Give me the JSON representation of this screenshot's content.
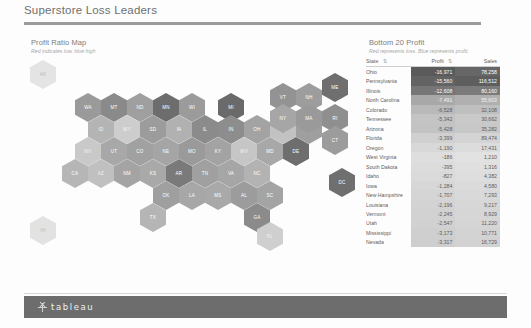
{
  "header": {
    "dashboard_title": "Superstore Loss Leaders"
  },
  "map_section": {
    "title": "Profit Ratio Map",
    "subtitle": "Red indicates low, blue high"
  },
  "table_section": {
    "title": "Bottom 20 Profit",
    "subtitle": "Red represents loss.  Blue represents profit.",
    "columns": [
      "State",
      "Profit",
      "Sales"
    ],
    "sort_icon": "sort-ascending-icon",
    "rows": [
      {
        "state": "Ohio",
        "profit": "-16,971",
        "sales": "78,258",
        "profit_bg": "#5a5a5a",
        "sales_bg": "#676767",
        "text": "#ffffff"
      },
      {
        "state": "Pennsylvania",
        "profit": "-15,560",
        "sales": "116,512",
        "profit_bg": "#636363",
        "sales_bg": "#5e5e5e",
        "text": "#ffffff"
      },
      {
        "state": "Illinois",
        "profit": "-12,608",
        "sales": "80,160",
        "profit_bg": "#767676",
        "sales_bg": "#7b7b7b",
        "text": "#ffffff"
      },
      {
        "state": "North Carolina",
        "profit": "-7,491",
        "sales": "55,603",
        "profit_bg": "#a8a8a8",
        "sales_bg": "#b0b0b0",
        "text": "#f4f4f4"
      },
      {
        "state": "Colorado",
        "profit": "-6,528",
        "sales": "32,108",
        "profit_bg": "#b9b9b9",
        "sales_bg": "#bfbfbf",
        "text": "#5d5d5d"
      },
      {
        "state": "Tennessee",
        "profit": "-5,342",
        "sales": "30,662",
        "profit_bg": "#c4c4c4",
        "sales_bg": "#c9c9c9",
        "text": "#5d5d5d"
      },
      {
        "state": "Arizona",
        "profit": "-5,428",
        "sales": "35,282",
        "profit_bg": "#c3c3c3",
        "sales_bg": "#c8c8c8",
        "text": "#5d5d5d"
      },
      {
        "state": "Florida",
        "profit": "-3,399",
        "sales": "89,474",
        "profit_bg": "#d0d0d0",
        "sales_bg": "#d4d4d4",
        "text": "#5d5d5d"
      },
      {
        "state": "Oregon",
        "profit": "-1,190",
        "sales": "17,431",
        "profit_bg": "#d8d8d8",
        "sales_bg": "#dcdcdc",
        "text": "#5d5d5d"
      },
      {
        "state": "West Virginia",
        "profit": "-186",
        "sales": "1,210",
        "profit_bg": "#dedede",
        "sales_bg": "#e2e2e2",
        "text": "#5d5d5d"
      },
      {
        "state": "South Dakota",
        "profit": "-395",
        "sales": "1,316",
        "profit_bg": "#dcdcdc",
        "sales_bg": "#e0e0e0",
        "text": "#5d5d5d"
      },
      {
        "state": "Idaho",
        "profit": "-827",
        "sales": "4,382",
        "profit_bg": "#dadada",
        "sales_bg": "#dedede",
        "text": "#5d5d5d"
      },
      {
        "state": "Iowa",
        "profit": "-1,284",
        "sales": "4,580",
        "profit_bg": "#d7d7d7",
        "sales_bg": "#dbdbdb",
        "text": "#5d5d5d"
      },
      {
        "state": "New Hampshire",
        "profit": "-1,707",
        "sales": "7,293",
        "profit_bg": "#d5d5d5",
        "sales_bg": "#d9d9d9",
        "text": "#5d5d5d"
      },
      {
        "state": "Louisiana",
        "profit": "-2,196",
        "sales": "9,217",
        "profit_bg": "#d3d3d3",
        "sales_bg": "#d7d7d7",
        "text": "#5d5d5d"
      },
      {
        "state": "Vermont",
        "profit": "-2,245",
        "sales": "8,929",
        "profit_bg": "#d2d2d2",
        "sales_bg": "#d6d6d6",
        "text": "#5d5d5d"
      },
      {
        "state": "Utah",
        "profit": "-2,547",
        "sales": "11,220",
        "profit_bg": "#d1d1d1",
        "sales_bg": "#d5d5d5",
        "text": "#5d5d5d"
      },
      {
        "state": "Mississippi",
        "profit": "-3,173",
        "sales": "10,771",
        "profit_bg": "#cfcfcf",
        "sales_bg": "#d3d3d3",
        "text": "#5d5d5d"
      },
      {
        "state": "Nevada",
        "profit": "-3,317",
        "sales": "16,729",
        "profit_bg": "#cecece",
        "sales_bg": "#d2d2d2",
        "text": "#5d5d5d"
      }
    ]
  },
  "hex_map": {
    "tiles": [
      {
        "abbr": "AK",
        "x": 6,
        "y": 4,
        "color": "#e4e4e4",
        "label": "#b8b8b8"
      },
      {
        "abbr": "WA",
        "x": 51,
        "y": 37,
        "color": "#9a9a9a",
        "label": "#ffffff"
      },
      {
        "abbr": "MT",
        "x": 77,
        "y": 37,
        "color": "#8a8a8a",
        "label": "#ffffff"
      },
      {
        "abbr": "ND",
        "x": 103,
        "y": 37,
        "color": "#9f9f9f",
        "label": "#ffffff"
      },
      {
        "abbr": "MN",
        "x": 129,
        "y": 37,
        "color": "#6d6d6d",
        "label": "#ffffff"
      },
      {
        "abbr": "WI",
        "x": 155,
        "y": 37,
        "color": "#9b9b9b",
        "label": "#ffffff"
      },
      {
        "abbr": "MI",
        "x": 194,
        "y": 37,
        "color": "#6a6a6a",
        "label": "#ffffff"
      },
      {
        "abbr": "VT",
        "x": 246,
        "y": 27,
        "color": "#939393",
        "label": "#ffffff"
      },
      {
        "abbr": "NH",
        "x": 272,
        "y": 27,
        "color": "#9d9d9d",
        "label": "#ffffff"
      },
      {
        "abbr": "ME",
        "x": 298,
        "y": 17,
        "color": "#6f6f6f",
        "label": "#ffffff"
      },
      {
        "abbr": "ID",
        "x": 64,
        "y": 59,
        "color": "#b4b4b4",
        "label": "#f4f4f4"
      },
      {
        "abbr": "WY",
        "x": 90,
        "y": 59,
        "color": "#cdcdcd",
        "label": "#f4f4f4"
      },
      {
        "abbr": "SD",
        "x": 116,
        "y": 59,
        "color": "#9c9c9c",
        "label": "#ffffff"
      },
      {
        "abbr": "IA",
        "x": 142,
        "y": 59,
        "color": "#b1b1b1",
        "label": "#ffffff"
      },
      {
        "abbr": "IL",
        "x": 168,
        "y": 59,
        "color": "#8b8b8b",
        "label": "#ffffff"
      },
      {
        "abbr": "IN",
        "x": 194,
        "y": 59,
        "color": "#8d8d8d",
        "label": "#ffffff"
      },
      {
        "abbr": "OH",
        "x": 220,
        "y": 59,
        "color": "#a3a3a3",
        "label": "#ffffff"
      },
      {
        "abbr": "PA",
        "x": 246,
        "y": 59,
        "color": "#c2c2c2",
        "label": "#f4f4f4"
      },
      {
        "abbr": "NJ",
        "x": 272,
        "y": 59,
        "color": "#9f9f9f",
        "label": "#ffffff"
      },
      {
        "abbr": "NY",
        "x": 246,
        "y": 48,
        "color": "#a6a6a6",
        "label": "#ffffff"
      },
      {
        "abbr": "MA",
        "x": 272,
        "y": 48,
        "color": "#9a9a9a",
        "label": "#ffffff"
      },
      {
        "abbr": "RI",
        "x": 298,
        "y": 48,
        "color": "#8f8f8f",
        "label": "#ffffff"
      },
      {
        "abbr": "CT",
        "x": 298,
        "y": 70,
        "color": "#9c9c9c",
        "label": "#ffffff"
      },
      {
        "abbr": "NV",
        "x": 51,
        "y": 81,
        "color": "#c9c9c9",
        "label": "#f4f4f4"
      },
      {
        "abbr": "UT",
        "x": 77,
        "y": 81,
        "color": "#a8a8a8",
        "label": "#ffffff"
      },
      {
        "abbr": "CO",
        "x": 103,
        "y": 81,
        "color": "#a1a1a1",
        "label": "#ffffff"
      },
      {
        "abbr": "NE",
        "x": 129,
        "y": 81,
        "color": "#a5a5a5",
        "label": "#ffffff"
      },
      {
        "abbr": "MO",
        "x": 155,
        "y": 81,
        "color": "#9a9a9a",
        "label": "#ffffff"
      },
      {
        "abbr": "KY",
        "x": 181,
        "y": 81,
        "color": "#a3a3a3",
        "label": "#ffffff"
      },
      {
        "abbr": "WV",
        "x": 207,
        "y": 81,
        "color": "#c6c6c6",
        "label": "#f4f4f4"
      },
      {
        "abbr": "MD",
        "x": 233,
        "y": 81,
        "color": "#a8a8a8",
        "label": "#ffffff"
      },
      {
        "abbr": "DE",
        "x": 259,
        "y": 81,
        "color": "#6e6e6e",
        "label": "#ffffff"
      },
      {
        "abbr": "CA",
        "x": 38,
        "y": 103,
        "color": "#b6b6b6",
        "label": "#ffffff"
      },
      {
        "abbr": "AZ",
        "x": 64,
        "y": 103,
        "color": "#c0c0c0",
        "label": "#f4f4f4"
      },
      {
        "abbr": "NM",
        "x": 90,
        "y": 103,
        "color": "#a4a4a4",
        "label": "#ffffff"
      },
      {
        "abbr": "KS",
        "x": 116,
        "y": 103,
        "color": "#a9a9a9",
        "label": "#ffffff"
      },
      {
        "abbr": "AR",
        "x": 142,
        "y": 103,
        "color": "#7a7a7a",
        "label": "#ffffff"
      },
      {
        "abbr": "TN",
        "x": 168,
        "y": 103,
        "color": "#a0a0a0",
        "label": "#ffffff"
      },
      {
        "abbr": "VA",
        "x": 194,
        "y": 103,
        "color": "#a6a6a6",
        "label": "#ffffff"
      },
      {
        "abbr": "NC",
        "x": 220,
        "y": 103,
        "color": "#b3b3b3",
        "label": "#ffffff"
      },
      {
        "abbr": "OK",
        "x": 129,
        "y": 125,
        "color": "#9f9f9f",
        "label": "#ffffff"
      },
      {
        "abbr": "LA",
        "x": 155,
        "y": 125,
        "color": "#a7a7a7",
        "label": "#ffffff"
      },
      {
        "abbr": "MS",
        "x": 181,
        "y": 125,
        "color": "#a9a9a9",
        "label": "#ffffff"
      },
      {
        "abbr": "AL",
        "x": 207,
        "y": 125,
        "color": "#9c9c9c",
        "label": "#ffffff"
      },
      {
        "abbr": "SC",
        "x": 233,
        "y": 125,
        "color": "#a4a4a4",
        "label": "#ffffff"
      },
      {
        "abbr": "TX",
        "x": 116,
        "y": 147,
        "color": "#b5b5b5",
        "label": "#ffffff"
      },
      {
        "abbr": "GA",
        "x": 220,
        "y": 147,
        "color": "#8b8b8b",
        "label": "#ffffff"
      },
      {
        "abbr": "FL",
        "x": 233,
        "y": 166,
        "color": "#cfcfcf",
        "label": "#f4f4f4"
      },
      {
        "abbr": "HI",
        "x": 6,
        "y": 160,
        "color": "#e2e2e2",
        "label": "#bcbcbc"
      },
      {
        "abbr": "DC",
        "x": 305,
        "y": 112,
        "color": "#6f6f6f",
        "label": "#ffffff"
      }
    ]
  },
  "footer": {
    "brand": "tableau",
    "logo": "tableau-asterisk-logo"
  }
}
